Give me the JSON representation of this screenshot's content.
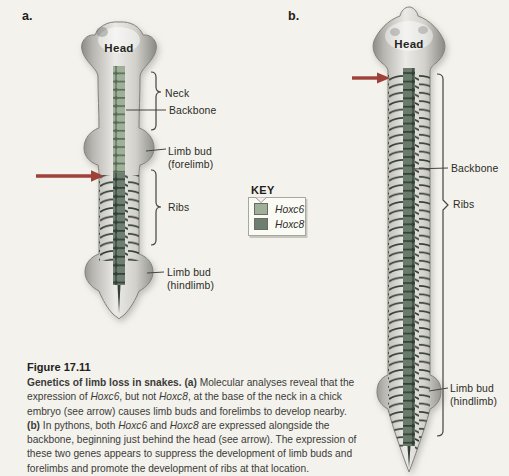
{
  "page": {
    "background": "#f3f2ec"
  },
  "panel_a": {
    "label": "a.",
    "head_label": "Head",
    "neck_label": "Neck",
    "backbone_label": "Backbone",
    "forelimb_label_line1": "Limb bud",
    "forelimb_label_line2": "(forelimb)",
    "ribs_label": "Ribs",
    "hindlimb_label_line1": "Limb bud",
    "hindlimb_label_line2": "(hindlimb)"
  },
  "panel_b": {
    "label": "b.",
    "head_label": "Head",
    "backbone_label": "Backbone",
    "ribs_label": "Ribs",
    "hindlimb_label_line1": "Limb bud",
    "hindlimb_label_line2": "(hindlimb)"
  },
  "key": {
    "title": "KEY",
    "items": [
      {
        "gene": "Hoxc6",
        "color": "#9fb098"
      },
      {
        "gene": "Hoxc8",
        "color": "#6d7f70"
      }
    ]
  },
  "caption": {
    "title": "Figure 17.11",
    "runs": [
      {
        "text": "Genetics of limb loss in snakes. (a) ",
        "bold": true
      },
      {
        "text": "Molecular analyses reveal that the expression of "
      },
      {
        "text": "Hoxc6",
        "italic": true
      },
      {
        "text": ", but not "
      },
      {
        "text": "Hoxc8",
        "italic": true
      },
      {
        "text": ", at the base of the neck in a chick embryo (see arrow) causes limb buds and forelimbs to develop nearby. "
      },
      {
        "text": "(b)",
        "bold": true
      },
      {
        "text": " In pythons, both "
      },
      {
        "text": "Hoxc6",
        "italic": true
      },
      {
        "text": " and "
      },
      {
        "text": "Hoxc8",
        "italic": true
      },
      {
        "text": " are expressed alongside the backbone, beginning just behind the head (see arrow). The expression of these two genes appears to suppress the development of limb buds and forelimbs and promote the development of ribs at that location."
      }
    ]
  },
  "colors": {
    "arrow": "#9e4138",
    "hoxc6_light_green": "#9fb098",
    "hoxc8_dark_green": "#6d7f70",
    "segment_gap_dark": "#343f36"
  }
}
